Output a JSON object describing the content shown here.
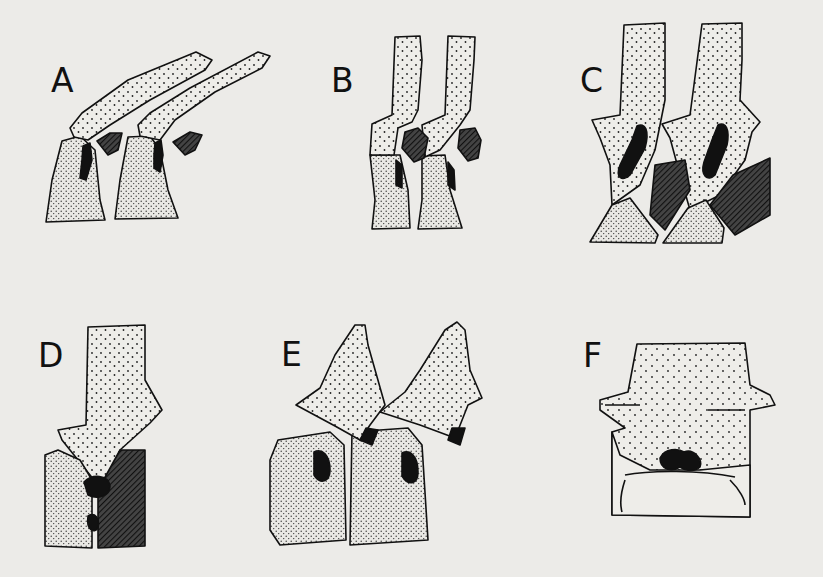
{
  "figure": {
    "background": "#ecebe8",
    "ink_color": "#111111",
    "panels": [
      {
        "label": "A",
        "description": "two tilted vertebrae with elongated neural spines and hatched process fragments"
      },
      {
        "label": "B",
        "description": "two upright vertebrae with tall neural spines and hatched oval elements"
      },
      {
        "label": "C",
        "description": "two vertebrae with broad spines, black foramina and hatched blocks"
      },
      {
        "label": "D",
        "description": "single vertebra on split centrum, half stippled half hatched"
      },
      {
        "label": "E",
        "description": "two vertebrae with hooked spines over rounded centra with dark foramina"
      },
      {
        "label": "F",
        "description": "single vertebra in end view with lateral processes and dark foramen"
      }
    ]
  }
}
